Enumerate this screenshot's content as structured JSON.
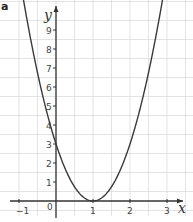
{
  "part_label": "a",
  "chart_data": {
    "type": "line",
    "title": "",
    "function": "y = 3(x - 1)^2",
    "xlabel": "x",
    "ylabel": "y",
    "xlim": [
      -1.0,
      3.3
    ],
    "ylim": [
      -0.8,
      10.2
    ],
    "grid": true,
    "grid_x_step": 0.5,
    "grid_y_step": 1,
    "x_ticks": [
      -1,
      0,
      1,
      2,
      3
    ],
    "x_tick_labels": [
      "-1",
      "0",
      "1",
      "2",
      "3"
    ],
    "y_ticks": [
      1,
      2,
      3,
      4,
      5,
      6,
      7,
      8,
      9
    ],
    "y_tick_labels": [
      "1",
      "2",
      "3",
      "4",
      "5",
      "6",
      "7",
      "8",
      "9"
    ],
    "series": [
      {
        "name": "parabola",
        "x": [
          -0.84,
          -0.5,
          0,
          0.5,
          1,
          1.5,
          2,
          2.5,
          2.82
        ],
        "y": [
          10.16,
          6.75,
          3,
          0.75,
          0,
          0.75,
          3,
          6.75,
          9.94
        ]
      }
    ],
    "key_points": {
      "y_intercept": [
        0,
        3
      ],
      "vertex": [
        1,
        0
      ]
    }
  },
  "style": {
    "grid_color": "#dcdcdc",
    "axis_color": "#333333",
    "curve_color": "#3a3a3a"
  }
}
